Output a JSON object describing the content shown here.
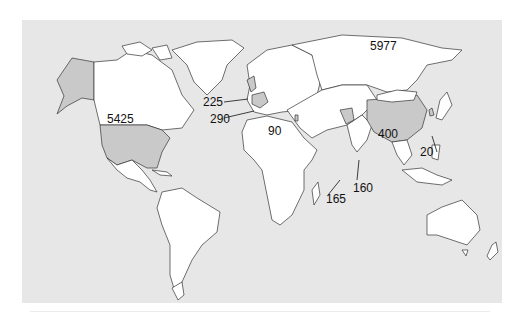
{
  "map": {
    "type": "choropleth-world",
    "background_color": "#e7e7e7",
    "land_color": "#ffffff",
    "highlight_color": "#c9c9c9",
    "border_color": "#333333",
    "labels": [
      {
        "id": "usa",
        "region": "United States",
        "value": "5425"
      },
      {
        "id": "russia",
        "region": "Russia",
        "value": "5977"
      },
      {
        "id": "uk",
        "region": "United Kingdom",
        "value": "225"
      },
      {
        "id": "france",
        "region": "France",
        "value": "290"
      },
      {
        "id": "israel",
        "region": "Israel",
        "value": "90"
      },
      {
        "id": "china",
        "region": "China",
        "value": "400"
      },
      {
        "id": "north-korea",
        "region": "North Korea",
        "value": "20"
      },
      {
        "id": "pakistan",
        "region": "Pakistan",
        "value": "165"
      },
      {
        "id": "india",
        "region": "India",
        "value": "160"
      }
    ]
  }
}
